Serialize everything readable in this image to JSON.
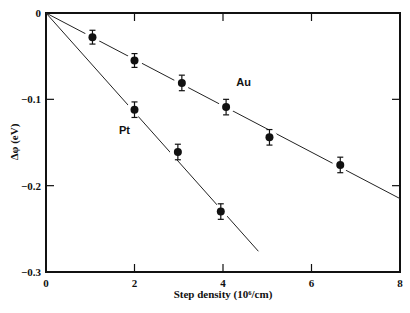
{
  "chart_data": {
    "type": "scatter",
    "title": "",
    "xlabel": "Step density (10⁶/cm)",
    "ylabel": "Δφ (eV)",
    "xlim": [
      0,
      8
    ],
    "ylim": [
      -0.3,
      0
    ],
    "xticks": [
      0,
      2,
      4,
      6,
      8
    ],
    "xtick_labels": [
      "0",
      "2",
      "4",
      "6",
      "8"
    ],
    "yticks": [
      0,
      -0.1,
      -0.2,
      -0.3
    ],
    "ytick_labels": [
      "0",
      "−0.1",
      "−0.2",
      "−0.3"
    ],
    "grid": false,
    "legend": "inline labels",
    "series": [
      {
        "name": "Au",
        "label_pos": [
          4.3,
          -0.085
        ],
        "x": [
          1.05,
          2.0,
          3.07,
          4.07,
          5.05,
          6.65
        ],
        "y": [
          -0.028,
          -0.055,
          -0.081,
          -0.109,
          -0.144,
          -0.176
        ],
        "yerr": [
          0.008,
          0.008,
          0.009,
          0.009,
          0.009,
          0.009
        ],
        "fit_line": {
          "x": [
            0,
            8
          ],
          "y": [
            0,
            -0.215
          ]
        }
      },
      {
        "name": "Pt",
        "label_pos": [
          1.65,
          -0.14
        ],
        "x": [
          2.0,
          2.98,
          3.95
        ],
        "y": [
          -0.112,
          -0.161,
          -0.23
        ],
        "yerr": [
          0.009,
          0.009,
          0.009
        ],
        "fit_line": {
          "x": [
            0,
            4.8
          ],
          "y": [
            0,
            -0.276
          ]
        }
      }
    ]
  }
}
